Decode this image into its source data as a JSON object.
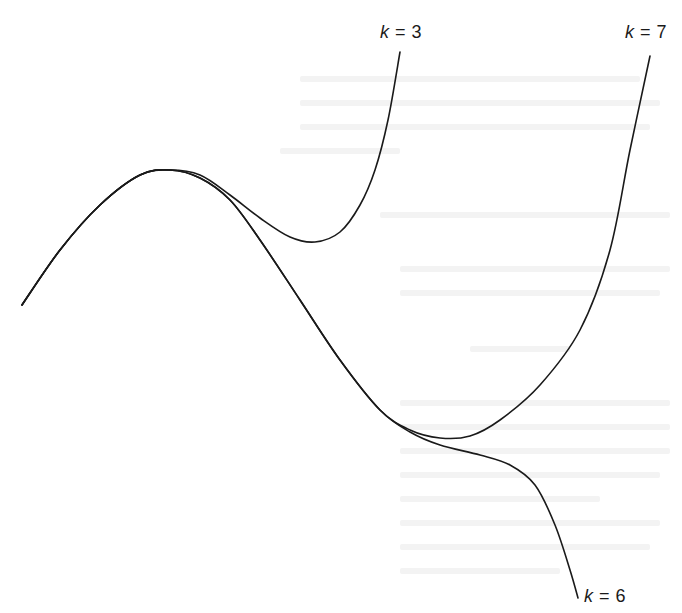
{
  "chart_data": {
    "type": "line",
    "title": "",
    "xlabel": "",
    "ylabel": "",
    "grid": false,
    "axes_visible": false,
    "legend_position": "inline curve-end labels",
    "series": [
      {
        "name": "k = 3",
        "label_var": "k",
        "label_value": "3",
        "label_position": [
          402,
          36
        ],
        "pixel_path": [
          [
            22,
            305
          ],
          [
            60,
            250
          ],
          [
            100,
            205
          ],
          [
            140,
            175
          ],
          [
            170,
            170
          ],
          [
            200,
            175
          ],
          [
            230,
            195
          ],
          [
            260,
            218
          ],
          [
            290,
            237
          ],
          [
            315,
            242
          ],
          [
            340,
            232
          ],
          [
            360,
            205
          ],
          [
            375,
            170
          ],
          [
            388,
            120
          ],
          [
            400,
            52
          ]
        ]
      },
      {
        "name": "k = 7",
        "label_var": "k",
        "label_value": "7",
        "label_position": [
          626,
          36
        ],
        "pixel_path": [
          [
            22,
            305
          ],
          [
            60,
            250
          ],
          [
            100,
            205
          ],
          [
            140,
            175
          ],
          [
            170,
            170
          ],
          [
            200,
            178
          ],
          [
            230,
            200
          ],
          [
            260,
            240
          ],
          [
            300,
            300
          ],
          [
            340,
            360
          ],
          [
            380,
            410
          ],
          [
            410,
            430
          ],
          [
            440,
            438
          ],
          [
            470,
            436
          ],
          [
            500,
            420
          ],
          [
            540,
            385
          ],
          [
            580,
            330
          ],
          [
            610,
            250
          ],
          [
            630,
            150
          ],
          [
            650,
            56
          ]
        ]
      },
      {
        "name": "k = 6",
        "label_var": "k",
        "label_value": "6",
        "label_position": [
          585,
          600
        ],
        "pixel_path": [
          [
            22,
            305
          ],
          [
            60,
            250
          ],
          [
            100,
            205
          ],
          [
            140,
            175
          ],
          [
            170,
            170
          ],
          [
            200,
            178
          ],
          [
            230,
            200
          ],
          [
            260,
            240
          ],
          [
            300,
            300
          ],
          [
            340,
            360
          ],
          [
            380,
            410
          ],
          [
            410,
            432
          ],
          [
            440,
            445
          ],
          [
            480,
            455
          ],
          [
            510,
            465
          ],
          [
            535,
            485
          ],
          [
            555,
            525
          ],
          [
            570,
            570
          ],
          [
            578,
            598
          ]
        ]
      }
    ]
  },
  "labels": {
    "k3": {
      "var": "k",
      "eq": " = 3"
    },
    "k6": {
      "var": "k",
      "eq": " = 6"
    },
    "k7": {
      "var": "k",
      "eq": " = 7"
    }
  },
  "colors": {
    "line": "#1a1a1a",
    "background": "#ffffff",
    "bleed_through": "#f3f3f3"
  }
}
